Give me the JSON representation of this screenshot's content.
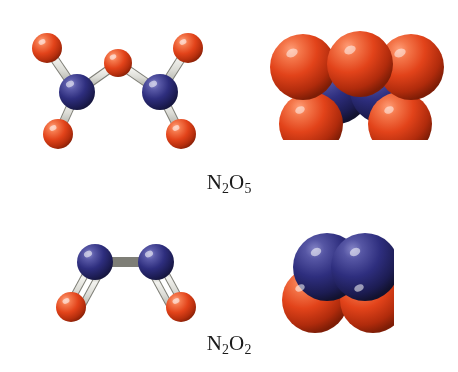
{
  "figure": {
    "background_color": "#ffffff",
    "width": 458,
    "height": 372,
    "kind": "molecular-structure-figure"
  },
  "palette": {
    "oxygen_red": "#E2431A",
    "oxygen_red_light": "#F4764A",
    "oxygen_red_dark": "#8E2208",
    "nitrogen_blue": "#2E2E7E",
    "nitrogen_blue_light": "#5A5AA8",
    "nitrogen_blue_dark": "#16163F",
    "bond_gray": "#D9D9D4",
    "bond_gray_dark": "#9A9A93",
    "bond_highlight": "#F2F2EE",
    "text_color": "#1a1a1a"
  },
  "labels": {
    "n2o5": {
      "formula": "N",
      "sub1": "2",
      "element2": "O",
      "sub2": "5",
      "full_text": "N2O5"
    },
    "n2o2": {
      "formula": "N",
      "sub1": "2",
      "element2": "O",
      "sub2": "2",
      "full_text": "N2O2"
    }
  },
  "molecules": [
    {
      "id": "n2o5-ball-and-stick",
      "name": "N2O5 ball-and-stick model",
      "representation": "ball-and-stick",
      "formula": "N2O5",
      "atoms": [
        {
          "element": "O",
          "label": "O-terminal-upper-left",
          "x": 47,
          "y": 48,
          "r": 15
        },
        {
          "element": "O",
          "label": "O-bridging-center",
          "x": 118,
          "y": 63,
          "r": 14
        },
        {
          "element": "O",
          "label": "O-terminal-upper-right",
          "x": 188,
          "y": 48,
          "r": 15
        },
        {
          "element": "N",
          "label": "N-left",
          "x": 77,
          "y": 92,
          "r": 18
        },
        {
          "element": "N",
          "label": "N-right",
          "x": 160,
          "y": 92,
          "r": 18
        },
        {
          "element": "O",
          "label": "O-terminal-lower-left",
          "x": 58,
          "y": 134,
          "r": 15
        },
        {
          "element": "O",
          "label": "O-terminal-lower-right",
          "x": 181,
          "y": 134,
          "r": 15
        }
      ],
      "bonds": [
        {
          "from": "N-left",
          "to": "O-terminal-upper-left",
          "order": 1
        },
        {
          "from": "N-left",
          "to": "O-bridging-center",
          "order": 1
        },
        {
          "from": "N-left",
          "to": "O-terminal-lower-left",
          "order": 1
        },
        {
          "from": "N-right",
          "to": "O-bridging-center",
          "order": 1
        },
        {
          "from": "N-right",
          "to": "O-terminal-upper-right",
          "order": 1
        },
        {
          "from": "N-right",
          "to": "O-terminal-lower-right",
          "order": 1
        }
      ]
    },
    {
      "id": "n2o5-space-filling",
      "name": "N2O5 space-filling model",
      "representation": "space-filling",
      "formula": "N2O5",
      "atoms": [
        {
          "element": "N",
          "label": "N-left",
          "x": 336,
          "y": 90,
          "r": 34
        },
        {
          "element": "N",
          "label": "N-right",
          "x": 384,
          "y": 90,
          "r": 34
        },
        {
          "element": "O",
          "label": "O-lower-left",
          "x": 311,
          "y": 124,
          "r": 32
        },
        {
          "element": "O",
          "label": "O-lower-right",
          "x": 400,
          "y": 124,
          "r": 32
        },
        {
          "element": "O",
          "label": "O-upper-left",
          "x": 303,
          "y": 67,
          "r": 33
        },
        {
          "element": "O",
          "label": "O-upper-center",
          "x": 360,
          "y": 64,
          "r": 33
        },
        {
          "element": "O",
          "label": "O-upper-right",
          "x": 411,
          "y": 67,
          "r": 33
        }
      ]
    },
    {
      "id": "n2o2-ball-and-stick",
      "name": "N2O2 ball-and-stick model",
      "representation": "ball-and-stick",
      "formula": "N2O2",
      "atoms": [
        {
          "element": "N",
          "label": "N-left",
          "x": 95,
          "y": 262,
          "r": 18
        },
        {
          "element": "N",
          "label": "N-right",
          "x": 156,
          "y": 262,
          "r": 18
        },
        {
          "element": "O",
          "label": "O-left",
          "x": 71,
          "y": 307,
          "r": 15
        },
        {
          "element": "O",
          "label": "O-right",
          "x": 181,
          "y": 307,
          "r": 15
        }
      ],
      "bonds": [
        {
          "from": "N-left",
          "to": "N-right",
          "order": 1
        },
        {
          "from": "N-left",
          "to": "O-left",
          "order": 2
        },
        {
          "from": "N-right",
          "to": "O-right",
          "order": 2
        }
      ]
    },
    {
      "id": "n2o2-space-filling",
      "name": "N2O2 space-filling model",
      "representation": "space-filling",
      "formula": "N2O2",
      "atoms": [
        {
          "element": "O",
          "label": "O-left",
          "x": 315,
          "y": 300,
          "r": 33
        },
        {
          "element": "O",
          "label": "O-right",
          "x": 373,
          "y": 300,
          "r": 33
        },
        {
          "element": "N",
          "label": "N-left",
          "x": 327,
          "y": 267,
          "r": 34
        },
        {
          "element": "N",
          "label": "N-right",
          "x": 365,
          "y": 267,
          "r": 34
        }
      ]
    }
  ]
}
